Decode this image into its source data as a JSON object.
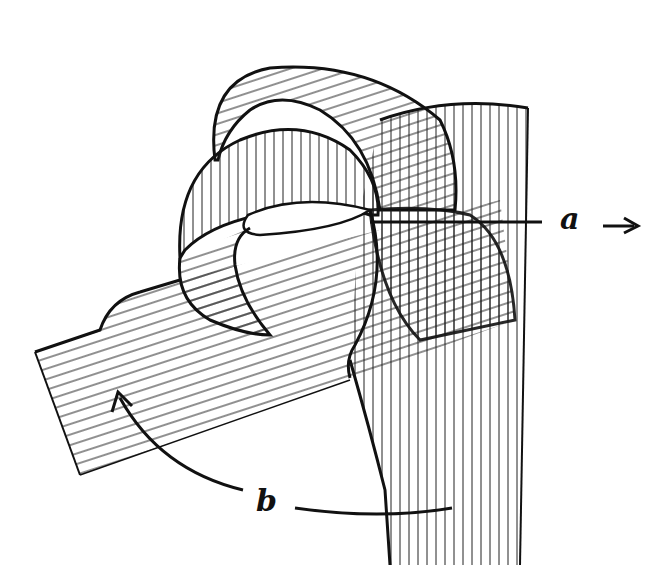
{
  "diagram": {
    "type": "hand-drawn technical sketch",
    "labels": {
      "a": "a",
      "a_arrow": "→",
      "b": "b"
    },
    "colors": {
      "ink": "#111111",
      "paper": "#ffffff"
    }
  }
}
